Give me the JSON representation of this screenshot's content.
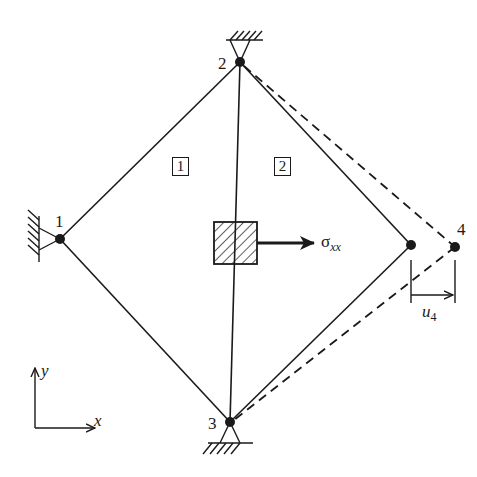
{
  "diagram": {
    "type": "finite-element-mesh",
    "nodes": [
      {
        "id": "1",
        "label": "1",
        "x": 60,
        "y": 239,
        "support": "pin-left"
      },
      {
        "id": "2",
        "label": "2",
        "x": 240,
        "y": 62,
        "support": "pin-top"
      },
      {
        "id": "3",
        "label": "3",
        "x": 230,
        "y": 422,
        "support": "pin-bottom"
      },
      {
        "id": "r",
        "label": "",
        "x": 411,
        "y": 245,
        "support": "none"
      },
      {
        "id": "4",
        "label": "4",
        "x": 455,
        "y": 247,
        "support": "none",
        "displaced": true
      }
    ],
    "elements": [
      {
        "label": "1",
        "nodes": [
          "1",
          "2",
          "3"
        ]
      },
      {
        "label": "2",
        "nodes": [
          "2",
          "r",
          "3"
        ]
      }
    ],
    "element_labels": {
      "e1": "1",
      "e2": "2"
    },
    "node_labels": {
      "n1": "1",
      "n2": "2",
      "n3": "3",
      "n4": "4"
    },
    "stress": {
      "symbol": "σ",
      "subscript": "xx"
    },
    "displacement": {
      "symbol": "u",
      "subscript": "4"
    },
    "axes": {
      "x": "x",
      "y": "y"
    },
    "colors": {
      "ink": "#1a1a1a",
      "background": "#ffffff"
    }
  }
}
